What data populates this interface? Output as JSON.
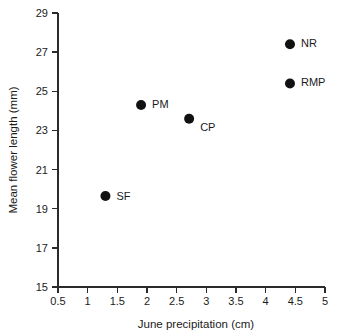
{
  "chart_data": {
    "type": "scatter",
    "title": "",
    "xlabel": "June precipitation (cm)",
    "ylabel": "Mean flower length (mm)",
    "xlim": [
      0.5,
      5
    ],
    "ylim": [
      15,
      29
    ],
    "xticks": [
      0.5,
      1,
      1.5,
      2,
      2.5,
      3,
      3.5,
      4,
      4.5,
      5
    ],
    "xtick_labels": [
      "0.5",
      "1",
      "1.5",
      "2",
      "2.5",
      "3",
      "3.5",
      "4",
      "4.5",
      "5"
    ],
    "yticks": [
      15,
      17,
      19,
      21,
      23,
      25,
      27,
      29
    ],
    "ytick_labels": [
      "15",
      "17",
      "19",
      "21",
      "23",
      "25",
      "27",
      "29"
    ],
    "grid": false,
    "legend": "none",
    "marker_color": "#111111",
    "axis_color": "#2b2b2b",
    "points": [
      {
        "label": "SF",
        "x": 1.3,
        "y": 19.65,
        "label_dx": 11,
        "label_dy": 1
      },
      {
        "label": "PM",
        "x": 1.9,
        "y": 24.3,
        "label_dx": 11,
        "label_dy": 0
      },
      {
        "label": "CP",
        "x": 2.71,
        "y": 23.6,
        "label_dx": 11,
        "label_dy": 9
      },
      {
        "label": "RMP",
        "x": 4.41,
        "y": 25.4,
        "label_dx": 11,
        "label_dy": 0
      },
      {
        "label": "NR",
        "x": 4.41,
        "y": 27.4,
        "label_dx": 11,
        "label_dy": 0
      }
    ]
  }
}
